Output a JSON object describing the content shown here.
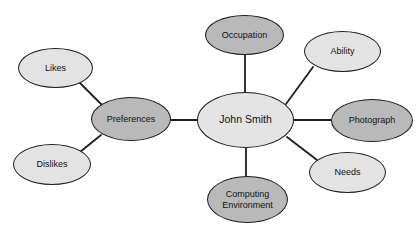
{
  "diagram": {
    "type": "mind-map",
    "canvas": {
      "width": 418,
      "height": 228,
      "background": "#ffffff"
    },
    "palette": {
      "fill_light": "#e3e3e3",
      "fill_dark": "#b9b9b9",
      "stroke": "#1d1d1d",
      "text": "#111111",
      "edge": "#1d1d1d"
    },
    "nodes": [
      {
        "id": "john-smith",
        "label": "John Smith",
        "shade": "light",
        "fill": "#e3e3e3",
        "x": 197,
        "y": 92,
        "w": 97,
        "h": 56,
        "font_size": 10.5,
        "role": "root"
      },
      {
        "id": "occupation",
        "label": "Occupation",
        "shade": "dark",
        "fill": "#b9b9b9",
        "x": 205,
        "y": 15,
        "w": 79,
        "h": 40,
        "font_size": 9,
        "role": "branch"
      },
      {
        "id": "ability",
        "label": "Ability",
        "shade": "light",
        "fill": "#e3e3e3",
        "x": 304,
        "y": 31,
        "w": 77,
        "h": 41,
        "font_size": 9,
        "role": "branch"
      },
      {
        "id": "photograph",
        "label": "Photograph",
        "shade": "dark",
        "fill": "#b9b9b9",
        "x": 331,
        "y": 99,
        "w": 82,
        "h": 43,
        "font_size": 9,
        "role": "branch"
      },
      {
        "id": "needs",
        "label": "Needs",
        "shade": "light",
        "fill": "#e3e3e3",
        "x": 309,
        "y": 152,
        "w": 77,
        "h": 41,
        "font_size": 9,
        "role": "branch"
      },
      {
        "id": "computing-environment",
        "label": "Computing\nEnvironment",
        "shade": "dark",
        "fill": "#b9b9b9",
        "x": 207,
        "y": 176,
        "w": 81,
        "h": 47,
        "font_size": 9,
        "role": "branch"
      },
      {
        "id": "preferences",
        "label": "Preferences",
        "shade": "dark",
        "fill": "#b9b9b9",
        "x": 91,
        "y": 97,
        "w": 80,
        "h": 44,
        "font_size": 9,
        "role": "branch"
      },
      {
        "id": "likes",
        "label": "Likes",
        "shade": "light",
        "fill": "#e3e3e3",
        "x": 18,
        "y": 48,
        "w": 75,
        "h": 40,
        "font_size": 9,
        "role": "leaf"
      },
      {
        "id": "dislikes",
        "label": "Dislikes",
        "shade": "light",
        "fill": "#e3e3e3",
        "x": 13,
        "y": 144,
        "w": 78,
        "h": 41,
        "font_size": 9,
        "role": "leaf"
      }
    ],
    "edges": [
      {
        "id": "edge-john-smith-occupation",
        "from": "john-smith",
        "to": "occupation",
        "x1": 245,
        "y1": 93,
        "x2": 245,
        "y2": 55
      },
      {
        "id": "edge-john-smith-ability",
        "from": "john-smith",
        "to": "ability",
        "x1": 286,
        "y1": 104,
        "x2": 313,
        "y2": 67
      },
      {
        "id": "edge-john-smith-photograph",
        "from": "john-smith",
        "to": "photograph",
        "x1": 294,
        "y1": 120,
        "x2": 331,
        "y2": 120
      },
      {
        "id": "edge-john-smith-needs",
        "from": "john-smith",
        "to": "needs",
        "x1": 287,
        "y1": 137,
        "x2": 317,
        "y2": 160
      },
      {
        "id": "edge-john-smith-computing-environment",
        "from": "john-smith",
        "to": "computing-environment",
        "x1": 246,
        "y1": 147,
        "x2": 246,
        "y2": 177
      },
      {
        "id": "edge-john-smith-preferences",
        "from": "john-smith",
        "to": "preferences",
        "x1": 197,
        "y1": 120,
        "x2": 171,
        "y2": 120
      },
      {
        "id": "edge-preferences-likes",
        "from": "preferences",
        "to": "likes",
        "x1": 102,
        "y1": 105,
        "x2": 80,
        "y2": 83
      },
      {
        "id": "edge-preferences-dislikes",
        "from": "preferences",
        "to": "dislikes",
        "x1": 101,
        "y1": 135,
        "x2": 80,
        "y2": 152
      }
    ]
  }
}
